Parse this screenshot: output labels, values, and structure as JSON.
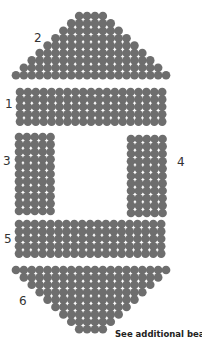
{
  "diagram": {
    "bead_color": "#6e6e6e",
    "bead_gap_color": "#ffffff",
    "bead_pitch_x": 7.9,
    "bead_pitch_y": 7.4,
    "bead_radius": 4.3,
    "sections": [
      {
        "id": "2",
        "label": "2",
        "label_pos": [
          34,
          32
        ],
        "shape": "triangle-up",
        "center_x": 91,
        "top_y": 16,
        "row_counts": [
          4,
          6,
          8,
          10,
          12,
          14,
          16,
          18,
          20
        ]
      },
      {
        "id": "1",
        "label": "1",
        "label_pos": [
          5,
          98
        ],
        "shape": "rectangle",
        "left_x": 20,
        "top_y": 92,
        "cols": 19,
        "rows": 5
      },
      {
        "id": "3",
        "label": "3",
        "label_pos": [
          3,
          155
        ],
        "shape": "rectangle",
        "left_x": 19,
        "top_y": 137,
        "cols": 5,
        "rows": 11
      },
      {
        "id": "4",
        "label": "4",
        "label_pos": [
          177,
          156
        ],
        "shape": "rectangle",
        "left_x": 131,
        "top_y": 139,
        "cols": 5,
        "rows": 11
      },
      {
        "id": "5",
        "label": "5",
        "label_pos": [
          4,
          233
        ],
        "shape": "rectangle",
        "left_x": 19,
        "top_y": 224,
        "cols": 19,
        "rows": 5
      },
      {
        "id": "6",
        "label": "6",
        "label_pos": [
          19,
          295
        ],
        "shape": "triangle-down",
        "center_x": 91,
        "top_y": 270,
        "row_counts": [
          20,
          18,
          16,
          14,
          12,
          10,
          8,
          6,
          4
        ]
      }
    ],
    "note": "See additional bead"
  }
}
